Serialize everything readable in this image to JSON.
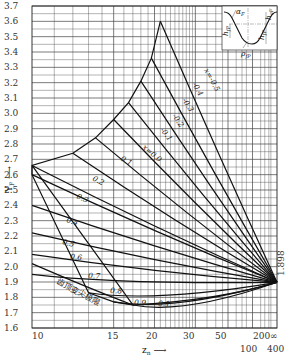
{
  "chart_data": {
    "type": "line",
    "title": "",
    "xlabel": "z_n",
    "ylabel": "Y_F",
    "x_scale": "reciprocal (1/z), 10 to infinity",
    "ylim": [
      1.6,
      3.7
    ],
    "grid": true,
    "y_ticks": [
      "3.7",
      "3.6",
      "3.5",
      "3.4",
      "3.3",
      "3.2",
      "3.1",
      "3.0",
      "2.9",
      "2.8",
      "2.7",
      "2.6",
      "2.5",
      "2.4",
      "2.3",
      "2.2",
      "2.1",
      "2.0",
      "1.9",
      "1.8",
      "1.7",
      "1.6"
    ],
    "x_ticks": [
      "10",
      "15",
      "20",
      "30",
      "50",
      "100",
      "200",
      "400",
      "∞"
    ],
    "convergence_value": "1.898",
    "convergence_point": {
      "z": "∞",
      "Y_F": 1.898
    },
    "boundary_label": "齿顶变尖极限",
    "inset": {
      "description": "tooth profile sketch",
      "labels": [
        "α_F",
        "h_aF",
        "h_fP",
        "ρ_fP"
      ]
    },
    "series": [
      {
        "name": "x=-0.5",
        "label": "x=-0.5",
        "start": {
          "z": 21,
          "Y_F": 3.6
        },
        "end": {
          "z": "∞",
          "Y_F": 1.898
        }
      },
      {
        "name": "x=-0.4",
        "label": "-0.4",
        "start": {
          "z": 19.5,
          "Y_F": 3.36
        },
        "end": {
          "z": "∞",
          "Y_F": 1.898
        }
      },
      {
        "name": "x=-0.3",
        "label": "-0.3",
        "start": {
          "z": 18,
          "Y_F": 3.21
        },
        "end": {
          "z": "∞",
          "Y_F": 1.898
        }
      },
      {
        "name": "x=-0.2",
        "label": "-0.2",
        "start": {
          "z": 16.5,
          "Y_F": 3.07
        },
        "end": {
          "z": "∞",
          "Y_F": 1.898
        }
      },
      {
        "name": "x=-0.1",
        "label": "-0.1",
        "start": {
          "z": 15,
          "Y_F": 2.96
        },
        "end": {
          "z": "∞",
          "Y_F": 1.898
        }
      },
      {
        "name": "x=0",
        "label": "x=0.0",
        "start": {
          "z": 13.5,
          "Y_F": 2.84
        },
        "end": {
          "z": "∞",
          "Y_F": 1.898
        }
      },
      {
        "name": "x=0.1",
        "label": "0.1",
        "start": {
          "z": 12,
          "Y_F": 2.74
        },
        "end": {
          "z": "∞",
          "Y_F": 1.898
        }
      },
      {
        "name": "x=0.2",
        "label": "0.2",
        "start": {
          "z": 10,
          "Y_F": 2.66
        },
        "end": {
          "z": "∞",
          "Y_F": 1.898
        }
      },
      {
        "name": "x=0.3",
        "label": "0.3",
        "start": {
          "z": 10,
          "Y_F": 2.6
        },
        "end": {
          "z": "∞",
          "Y_F": 1.898
        }
      },
      {
        "name": "x=0.4",
        "label": "0.4",
        "start": {
          "z": 10,
          "Y_F": 2.4
        },
        "end": {
          "z": "∞",
          "Y_F": 1.898
        }
      },
      {
        "name": "x=0.5",
        "label": "0.5",
        "start": {
          "z": 10,
          "Y_F": 2.22
        },
        "end": {
          "z": "∞",
          "Y_F": 1.898
        }
      },
      {
        "name": "x=0.6",
        "label": "0.6",
        "start": {
          "z": 10,
          "Y_F": 2.08
        },
        "end": {
          "z": "∞",
          "Y_F": 1.898
        }
      },
      {
        "name": "x=0.7",
        "label": "0.7",
        "start": {
          "z": 10,
          "Y_F": 1.95
        },
        "end": {
          "z": "∞",
          "Y_F": 1.898
        }
      },
      {
        "name": "x=0.8",
        "label": "0.8",
        "start": {
          "z": 13,
          "Y_F": 1.83
        },
        "end": {
          "z": "∞",
          "Y_F": 1.898
        }
      },
      {
        "name": "x=0.9",
        "label": "0.9",
        "start": {
          "z": 15,
          "Y_F": 1.77
        },
        "end": {
          "z": "∞",
          "Y_F": 1.898
        }
      },
      {
        "name": "x=1.0",
        "label": "1.0",
        "start": {
          "z": 17,
          "Y_F": 1.75
        },
        "end": {
          "z": "∞",
          "Y_F": 1.898
        }
      }
    ]
  },
  "labels": {
    "y_axis": "Y",
    "y_axis_sub": "F",
    "x_axis": "z",
    "x_axis_sub": "n",
    "convergence": "1.898",
    "boundary": "齿顶变尖极限",
    "inset_alpha": "α",
    "inset_alpha_sub": "F",
    "inset_haf": "h",
    "inset_haf_sub": "aF",
    "inset_hfp_left": "h",
    "inset_hfp_left_sub": "fP",
    "inset_hfp_right": "h",
    "inset_hfp_right_sub": "fP",
    "inset_rho": "ρ",
    "inset_rho_sub": "fP",
    "curves": [
      "x=-0.5",
      "-0.4",
      "-0.3",
      "-0.2",
      "-0.1",
      "x=0.0",
      "0.1",
      "0.2",
      "0.3",
      "0.4",
      "0.5",
      "0.6",
      "0.7",
      "0.8",
      "0.9",
      "0.1"
    ]
  }
}
